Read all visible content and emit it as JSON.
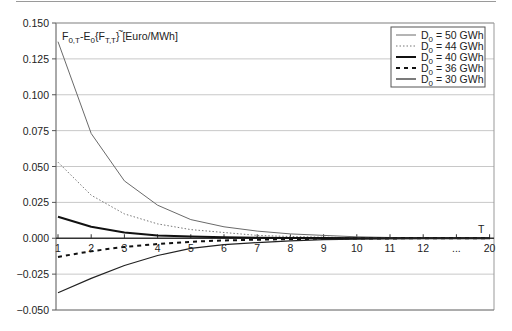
{
  "chart_data": {
    "type": "line",
    "title": "",
    "ylabel": "F0,T-E0{F~T,T} [Euro/MWh]",
    "ylabel_parts": {
      "main1": "F",
      "sub1": "0,T",
      "mid": "-E",
      "sub2": "0",
      "open": "{",
      "main2": "F",
      "sub3": "T,T",
      "close": "} [Euro/MWh]"
    },
    "xlabel": "T",
    "x": [
      1,
      2,
      3,
      4,
      5,
      6,
      7,
      8,
      9,
      10,
      11,
      12,
      "...",
      20
    ],
    "x_tick_labels": [
      "1",
      "2",
      "3",
      "4",
      "5",
      "6",
      "7",
      "8",
      "9",
      "10",
      "11",
      "12",
      "...",
      "20"
    ],
    "ylim": [
      -0.05,
      0.15
    ],
    "y_ticks": [
      0.15,
      0.125,
      0.1,
      0.075,
      0.05,
      0.025,
      0.0,
      -0.025,
      -0.05
    ],
    "y_tick_labels": [
      "0.150",
      "0.125",
      "0.100",
      "0.075",
      "0.050",
      "0.025",
      "0.000",
      "−0.025",
      "−0.050"
    ],
    "grid": "horizontal",
    "legend_position": "upper right",
    "series": [
      {
        "name": "D0 = 50 GWh",
        "label_main": "D",
        "label_sub": "0",
        "label_rest": " = 50 GWh",
        "style": "thin-solid",
        "color": "#555555",
        "values": [
          0.137,
          0.073,
          0.04,
          0.023,
          0.013,
          0.008,
          0.005,
          0.003,
          0.002,
          0.001,
          0.0005,
          0.0003,
          0.0001,
          0.0
        ]
      },
      {
        "name": "D0 = 44 GWh",
        "label_main": "D",
        "label_sub": "0",
        "label_rest": " = 44 GWh",
        "style": "dotted",
        "color": "#555555",
        "values": [
          0.053,
          0.03,
          0.017,
          0.01,
          0.006,
          0.004,
          0.002,
          0.0012,
          0.0007,
          0.0004,
          0.0002,
          0.0001,
          0.0,
          0.0
        ]
      },
      {
        "name": "D0 = 40 GWh",
        "label_main": "D",
        "label_sub": "0",
        "label_rest": " = 40 GWh",
        "style": "thick-solid",
        "color": "#111111",
        "values": [
          0.015,
          0.008,
          0.004,
          0.002,
          0.0012,
          0.0007,
          0.0004,
          0.0002,
          0.0001,
          0.0,
          0.0,
          0.0,
          0.0,
          0.0
        ]
      },
      {
        "name": "D0 = 36 GWh",
        "label_main": "D",
        "label_sub": "0",
        "label_rest": " = 36 GWh",
        "style": "dashed",
        "color": "#111111",
        "values": [
          -0.013,
          -0.009,
          -0.006,
          -0.004,
          -0.0025,
          -0.0015,
          -0.001,
          -0.0006,
          -0.0003,
          -0.0002,
          -0.0001,
          0.0,
          0.0,
          0.0
        ]
      },
      {
        "name": "D0 = 30 GWh",
        "label_main": "D",
        "label_sub": "0",
        "label_rest": " = 30 GWh",
        "style": "solid",
        "color": "#222222",
        "values": [
          -0.038,
          -0.028,
          -0.019,
          -0.012,
          -0.007,
          -0.0045,
          -0.003,
          -0.0018,
          -0.001,
          -0.0006,
          -0.0003,
          -0.0001,
          0.0,
          0.0
        ]
      }
    ]
  }
}
